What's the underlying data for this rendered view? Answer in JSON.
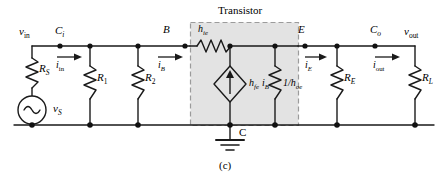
{
  "figure": {
    "caption": "(c)",
    "transistor_box_label": "Transistor"
  },
  "nodes": {
    "v_in": {
      "base": "v",
      "sub": "in"
    },
    "v_out": {
      "base": "v",
      "sub": "out"
    },
    "coupling_in": {
      "base": "C",
      "sub": "i"
    },
    "coupling_out": {
      "base": "C",
      "sub": "o"
    },
    "base_terminal": "B",
    "emitter_terminal": "E",
    "collector_terminal": "C"
  },
  "currents": {
    "i_in": {
      "base": "i",
      "sub": "in"
    },
    "i_B": {
      "base": "i",
      "sub": "B"
    },
    "i_E": {
      "base": "i",
      "sub": "E"
    },
    "i_out": {
      "base": "i",
      "sub": "out"
    }
  },
  "components": {
    "source_resistor": {
      "base": "R",
      "sub": "S"
    },
    "source_voltage": {
      "base": "v",
      "sub": "S"
    },
    "bias_r1": {
      "base": "R",
      "sub": "1"
    },
    "bias_r2": {
      "base": "R",
      "sub": "2"
    },
    "emitter_resistor": {
      "base": "R",
      "sub": "E"
    },
    "load_resistor": {
      "base": "R",
      "sub": "L"
    },
    "hie_resistor": {
      "base": "h",
      "sub": "ie"
    },
    "dependent_source": {
      "gain": "h",
      "gain_sub": "fe",
      "current": "i",
      "current_sub": "B"
    },
    "hoe_resistor": {
      "prefix": "1/",
      "base": "h",
      "sub": "oe"
    }
  },
  "colors": {
    "wire": "#1a1a1a",
    "box_fill": "#e2e2e2",
    "box_border": "#9a9a9a",
    "text": "#000000",
    "background": "#ffffff"
  },
  "symbols": {
    "ac_source_icon": "sine-wave",
    "ground_icon": "earth-ground",
    "dependent_source_icon": "diamond-current-source",
    "resistor_icon": "zigzag-resistor",
    "arrow_icon": "right-arrow"
  }
}
